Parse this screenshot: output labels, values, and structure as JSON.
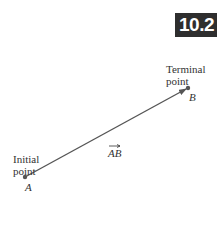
{
  "section_badge": {
    "text": "10.2",
    "background": "#2e2e2e",
    "color": "#ffffff"
  },
  "diagram": {
    "terminal_label_line1": "Terminal",
    "terminal_label_line2": "point",
    "terminal_point_name": "B",
    "initial_label_line1": "Initial",
    "initial_label_line2": "point",
    "initial_point_name": "A",
    "vector_label": "AB",
    "vector_color": "#555555",
    "point_color": "#555555"
  }
}
